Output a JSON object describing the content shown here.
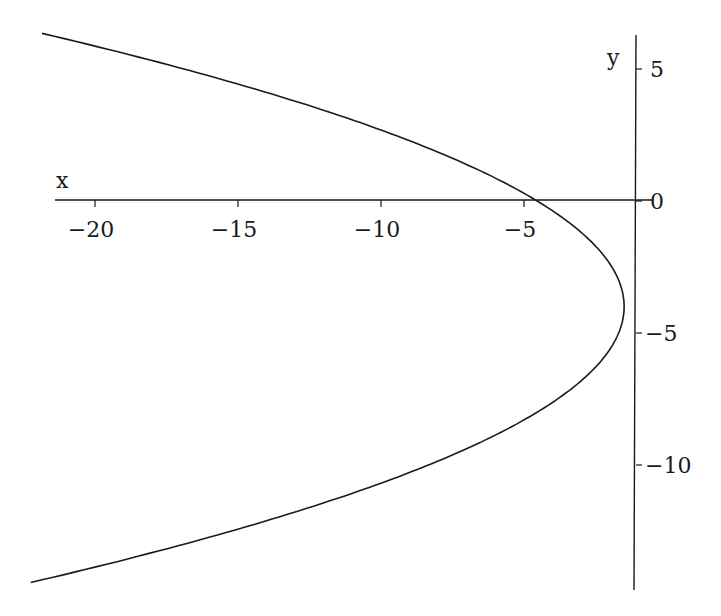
{
  "chart_data": {
    "type": "line",
    "title": "",
    "xlabel": "x",
    "ylabel": "y",
    "equation_estimate": "x = -1.5 - 0.19*(y + 4)^2",
    "xlim": [
      -22.1,
      -1.1
    ],
    "ylim": [
      -14.5,
      6.3
    ],
    "x_axis_at_y": 0,
    "y_axis_at_x": -1.1,
    "x_ticks": [
      -20,
      -15,
      -10,
      -5
    ],
    "x_tick_labels": [
      "−20",
      "−15",
      "−10",
      "−5"
    ],
    "y_ticks": [
      5,
      0,
      -5,
      -10
    ],
    "y_tick_labels": [
      "5",
      "0",
      "−5",
      "−10"
    ],
    "grid": false,
    "legend": null,
    "series": [
      {
        "name": "parabola",
        "color": "#1a1a1a",
        "points": [
          [
            -21.6,
            6.3
          ],
          [
            -18.7,
            5.5
          ],
          [
            -15.9,
            4.5
          ],
          [
            -13.4,
            3.5
          ],
          [
            -11.2,
            2.5
          ],
          [
            -9.2,
            1.5
          ],
          [
            -7.5,
            0.5
          ],
          [
            -4.5,
            -1.0
          ],
          [
            -3.2,
            -2.0
          ],
          [
            -1.99,
            -3.0
          ],
          [
            -1.5,
            -4.0
          ],
          [
            -1.69,
            -5.0
          ],
          [
            -2.26,
            -6.0
          ],
          [
            -3.21,
            -7.0
          ],
          [
            -4.54,
            -8.0
          ],
          [
            -6.25,
            -9.0
          ],
          [
            -8.34,
            -10.0
          ],
          [
            -10.81,
            -11.0
          ],
          [
            -13.66,
            -12.0
          ],
          [
            -16.89,
            -13.0
          ],
          [
            -20.5,
            -14.0
          ],
          [
            -22.3,
            -14.4
          ]
        ]
      }
    ]
  },
  "axes": {
    "x_label": "x",
    "y_label": "y"
  }
}
